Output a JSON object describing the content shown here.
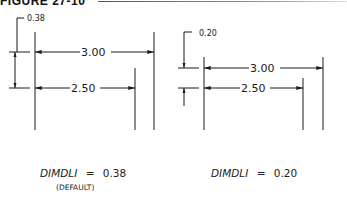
{
  "header": {
    "title": "FIGURE 27-10"
  },
  "panels": [
    {
      "spacing_label": "0.38",
      "dimensions": [
        {
          "value": "3.00"
        },
        {
          "value": "2.50"
        }
      ],
      "caption": {
        "variable": "DIMDLI",
        "equals": "=",
        "value": "0.38",
        "note": "(DEFAULT)"
      }
    },
    {
      "spacing_label": "0.20",
      "dimensions": [
        {
          "value": "3.00"
        },
        {
          "value": "2.50"
        }
      ],
      "caption": {
        "variable": "DIMDLI",
        "equals": "=",
        "value": "0.20"
      }
    }
  ],
  "colors": {
    "line": "#1a1a1a",
    "background": "#ffffff"
  }
}
